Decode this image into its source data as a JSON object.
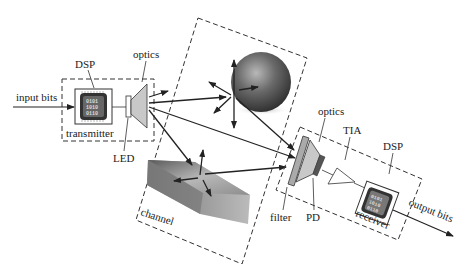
{
  "diagram": {
    "labels": {
      "input_bits": "input bits",
      "tx_dsp": "DSP",
      "tx_optics": "optics",
      "transmitter": "transmitter",
      "led": "LED",
      "channel": "channel",
      "rx_optics": "optics",
      "tia": "TIA",
      "rx_dsp": "DSP",
      "filter": "filter",
      "pd": "PD",
      "receiver": "receiver",
      "output_bits": "output bits"
    },
    "chip_bits": {
      "tx": [
        "0101",
        "1010",
        "0110"
      ],
      "rx": [
        "0101",
        "1010",
        "0110"
      ]
    },
    "blocks": [
      {
        "id": "transmitter",
        "contains": [
          "DSP",
          "LED",
          "optics"
        ]
      },
      {
        "id": "channel",
        "contains": [
          "sphere reflector",
          "prism reflector"
        ]
      },
      {
        "id": "receiver",
        "contains": [
          "filter",
          "optics",
          "PD",
          "TIA",
          "DSP"
        ]
      }
    ],
    "edges": [
      {
        "from": "input bits",
        "to": "transmitter DSP"
      },
      {
        "from": "transmitter optics",
        "to": "channel"
      },
      {
        "from": "channel",
        "to": "receiver filter"
      },
      {
        "from": "receiver DSP",
        "to": "output bits"
      }
    ],
    "colors": {
      "line": "#222222",
      "dash": "#333333",
      "optics_fill": "#c8c8c8",
      "sphere": "#555555",
      "chip": "#333333"
    }
  }
}
